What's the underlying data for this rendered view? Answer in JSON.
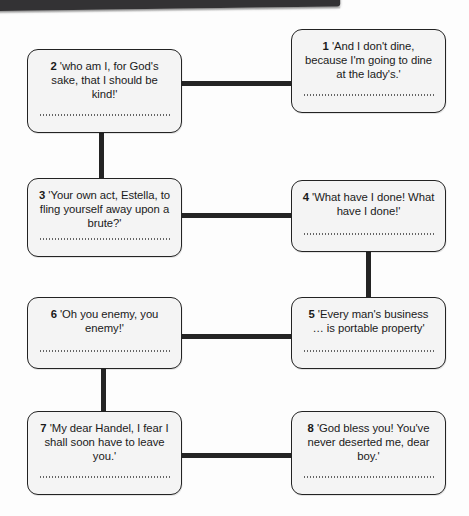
{
  "page": {
    "header_bar_color": "#333234",
    "box_fill_color": "#f4f4f4",
    "box_border_color": "#232323",
    "connector_color": "#242424"
  },
  "diagram": {
    "type": "flowchart",
    "title": "",
    "boxes": [
      {
        "id": "1",
        "number": "1",
        "quote": "'And I don't dine, because I'm going to dine at the lady's.'",
        "full_text": "1 'And I don't dine, because I'm going to dine at the lady's.'",
        "position": "row1-right"
      },
      {
        "id": "2",
        "number": "2",
        "quote": "'who am I, for God's sake, that I should be kind!'",
        "full_text": "2 'who am I, for God's sake, that I should be kind!'",
        "position": "row1-left"
      },
      {
        "id": "3",
        "number": "3",
        "quote": "'Your own act, Estella, to fling yourself away upon a brute?'",
        "full_text": "3 'Your own act, Estella, to fling yourself away upon a brute?'",
        "position": "row2-left"
      },
      {
        "id": "4",
        "number": "4",
        "quote": "'What have I done! What have I done!'",
        "full_text": "4 'What have I done! What have I done!'",
        "position": "row2-right"
      },
      {
        "id": "5",
        "number": "5",
        "quote": "'Every man's business … is portable property'",
        "full_text": "5 'Every man's business … is portable property'",
        "position": "row3-right"
      },
      {
        "id": "6",
        "number": "6",
        "quote": "'Oh you enemy, you enemy!'",
        "full_text": "6 'Oh you enemy, you enemy!'",
        "position": "row3-left"
      },
      {
        "id": "7",
        "number": "7",
        "quote": "'My dear Handel, I fear I shall soon have to leave you.'",
        "full_text": "7 'My dear Handel, I fear I shall soon have to leave you.'",
        "position": "row4-left"
      },
      {
        "id": "8",
        "number": "8",
        "quote": "'God bless you! You've never deserted me, dear boy.'",
        "full_text": "8 'God bless you! You've never deserted me, dear boy.'",
        "position": "row4-right"
      }
    ],
    "connectors": [
      {
        "from": "2",
        "to": "1",
        "orientation": "horizontal"
      },
      {
        "from": "2",
        "to": "3",
        "orientation": "vertical"
      },
      {
        "from": "3",
        "to": "4",
        "orientation": "horizontal"
      },
      {
        "from": "4",
        "to": "5",
        "orientation": "vertical"
      },
      {
        "from": "5",
        "to": "6",
        "orientation": "horizontal"
      },
      {
        "from": "6",
        "to": "7",
        "orientation": "vertical"
      },
      {
        "from": "7",
        "to": "8",
        "orientation": "horizontal"
      }
    ]
  }
}
